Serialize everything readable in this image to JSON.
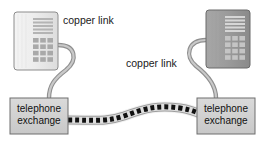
{
  "diagram": {
    "labels": [
      {
        "id": "copper-link-left",
        "text": "copper link",
        "x": 63,
        "y": 24
      },
      {
        "id": "copper-link-right",
        "text": "copper link",
        "x": 126,
        "y": 67
      }
    ],
    "exchanges": [
      {
        "id": "telephone-exchange-left",
        "line1": "telephone",
        "line2": "exchange",
        "x": 10,
        "y": 98,
        "width": 58,
        "height": 36
      },
      {
        "id": "telephone-exchange-right",
        "line1": "telephone",
        "line2": "exchange",
        "x": 197,
        "y": 98,
        "width": 58,
        "height": 36
      }
    ],
    "telephones": [
      {
        "id": "telephone-left",
        "x": 14,
        "y": 12,
        "width": 44,
        "height": 58,
        "shade": "light",
        "body_color": "#ebebeb",
        "border_color": "#8c8c8c",
        "display_rows": 5,
        "keypad_rows": 4,
        "keypad_cols": 3
      },
      {
        "id": "telephone-right",
        "x": 206,
        "y": 10,
        "width": 44,
        "height": 58,
        "shade": "dark",
        "body_color": "#9c9c9c",
        "border_color": "#6b6b6b",
        "display_rows": 5,
        "keypad_rows": 4,
        "keypad_cols": 3
      }
    ],
    "copper_cables": [
      {
        "id": "copper-cable-left",
        "path": "M 58 45 C 76 45 78 60 66 70 C 54 79 49 86 49 98",
        "color": "#9a9a9a",
        "width": 3.4
      },
      {
        "id": "copper-cable-right",
        "path": "M 206 40 C 188 40 184 56 196 66 C 209 76 216 86 216 98",
        "color": "#9a9a9a",
        "width": 3.4
      }
    ],
    "optical_link": {
      "id": "optical-link",
      "path": "M 68 120 C 96 120 106 122 124 116 C 146 108 158 105 180 108 C 194 110 200 114 207 117",
      "outline_color": "#a8a8a8",
      "outline_width": 9,
      "dash_color": "#111111",
      "dash_width": 5,
      "dash_pattern": "4 3"
    },
    "colors": {
      "background": "#ffffff",
      "box_fill": "#d2d2d2",
      "box_border": "#6e6e6e",
      "text": "#111111",
      "cable": "#9a9a9a",
      "link_dash": "#111111"
    }
  }
}
